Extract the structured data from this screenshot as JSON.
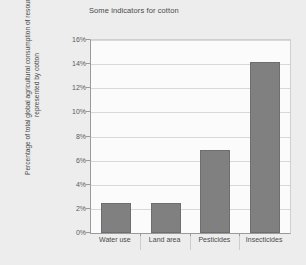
{
  "chart_data": {
    "type": "bar",
    "title": "Some indicators for cotton",
    "xlabel": "",
    "ylabel": "Percentage of total global agricultural consumption of resources represented by cotton",
    "ylabel_lines": [
      "Percentage of total global agricultural consumption of resources",
      "represented by cotton"
    ],
    "categories": [
      "Water use",
      "Land area",
      "Pesticides",
      "Insecticides"
    ],
    "values": [
      2.5,
      2.5,
      6.9,
      14.2
    ],
    "ylim": [
      0,
      16
    ],
    "ytick_step": 2,
    "ytick_labels": [
      "0%",
      "2%",
      "4%",
      "6%",
      "8%",
      "10%",
      "12%",
      "14%",
      "16%"
    ],
    "ytick_values": [
      0,
      2,
      4,
      6,
      8,
      10,
      12,
      14,
      16
    ],
    "value_unit": "%",
    "grid": true,
    "legend": false,
    "legend_position": "none",
    "colors": {
      "bar_fill": "#808080",
      "bar_border": "#6e6e6e",
      "plot_background": "#fbfbfb",
      "figure_background": "#ededed",
      "gridline": "#d8d8d8",
      "axis_line": "#9a9a9a",
      "text": "#4a4a4a"
    }
  }
}
